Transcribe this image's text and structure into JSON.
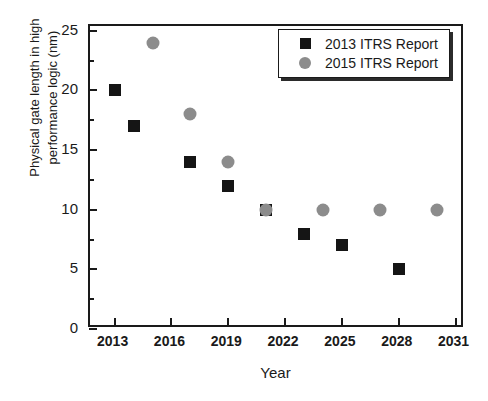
{
  "chart_data": {
    "type": "scatter",
    "title": "",
    "xlabel": "Year",
    "ylabel": "Physical gate length in high performance logic (nm)",
    "ylabel_line1": "Physical gate length in high",
    "ylabel_line2": "performance logic (nm)",
    "xlim": [
      2011.7,
      2031.5
    ],
    "ylim": [
      0,
      25.4
    ],
    "xticks": [
      2013,
      2016,
      2019,
      2022,
      2025,
      2028,
      2031
    ],
    "xtick_labels": [
      "2013",
      "2016",
      "2019",
      "2022",
      "2025",
      "2028",
      "2031"
    ],
    "yticks": [
      0,
      5,
      10,
      15,
      20,
      25
    ],
    "ytick_labels": [
      "0",
      "5",
      "10",
      "15",
      "20",
      "25"
    ],
    "yticks_minor": [
      2.5,
      7.5,
      12.5,
      17.5,
      22.5
    ],
    "grid": false,
    "legend_position": "top-right",
    "series": [
      {
        "name": "2013 ITRS Report",
        "marker": "square",
        "color": "#151515",
        "points": [
          {
            "x": 2013,
            "y": 20
          },
          {
            "x": 2014,
            "y": 17
          },
          {
            "x": 2017,
            "y": 14
          },
          {
            "x": 2019,
            "y": 12
          },
          {
            "x": 2021,
            "y": 10
          },
          {
            "x": 2023,
            "y": 8
          },
          {
            "x": 2025,
            "y": 7
          },
          {
            "x": 2028,
            "y": 5
          }
        ]
      },
      {
        "name": "2015 ITRS Report",
        "marker": "circle",
        "color": "#8c8c8c",
        "points": [
          {
            "x": 2015,
            "y": 24
          },
          {
            "x": 2017,
            "y": 18
          },
          {
            "x": 2019,
            "y": 14
          },
          {
            "x": 2021,
            "y": 10
          },
          {
            "x": 2024,
            "y": 10
          },
          {
            "x": 2027,
            "y": 10
          },
          {
            "x": 2030,
            "y": 10
          }
        ]
      }
    ]
  },
  "legend": {
    "entries": [
      {
        "label": "2013 ITRS Report",
        "marker": "square",
        "color": "#151515"
      },
      {
        "label": "2015 ITRS Report",
        "marker": "circle",
        "color": "#8c8c8c"
      }
    ]
  },
  "caption": {
    "text": ""
  }
}
